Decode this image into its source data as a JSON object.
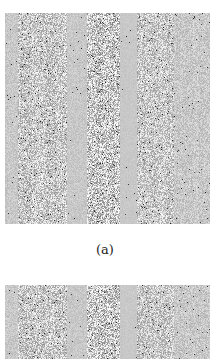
{
  "figure": {
    "panels": [
      {
        "id": "a",
        "caption": "(a)",
        "content": "grayscale noise texture with vertical bands"
      },
      {
        "id": "b",
        "caption": "",
        "content": "grayscale noise texture with vertical bands (partially visible)"
      }
    ],
    "colors": {
      "background": "#ffffff",
      "panel_base": "#c8c8c8",
      "dark_pixel": "#202020",
      "light_pixel": "#f4f4f4"
    }
  }
}
